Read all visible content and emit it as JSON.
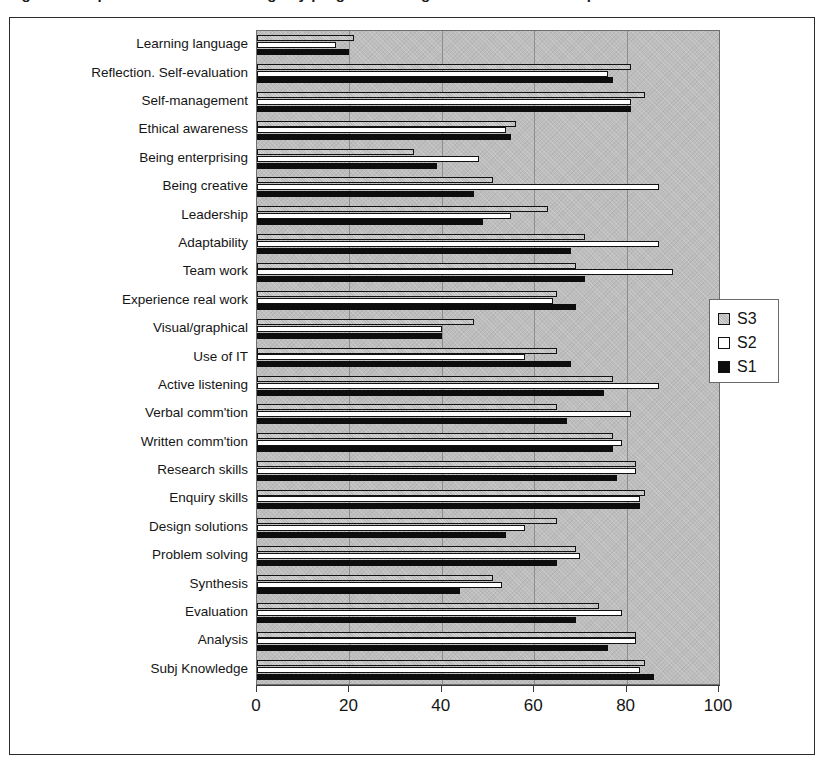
{
  "title": "Figure: Comparison of student ratings by programme stage across skills and capabilities",
  "chart_data": {
    "type": "bar",
    "orientation": "horizontal",
    "title": "",
    "xlabel": "",
    "ylabel": "",
    "xlim": [
      0,
      100
    ],
    "xticks": [
      0,
      20,
      40,
      60,
      80,
      100
    ],
    "xticklabels": [
      "0",
      "20",
      "40",
      "60",
      "80",
      "100"
    ],
    "grid": true,
    "grid_axis": "x",
    "legend_position": "right",
    "plot_background": "#bdbdbd",
    "series": [
      {
        "name": "S3",
        "color": "#b9b9b9",
        "values": [
          21,
          81,
          84,
          56,
          34,
          51,
          63,
          71,
          69,
          65,
          47,
          65,
          77,
          65,
          77,
          82,
          84,
          65,
          69,
          51,
          74,
          82,
          84
        ]
      },
      {
        "name": "S2",
        "color": "#ffffff",
        "values": [
          17,
          76,
          81,
          54,
          48,
          87,
          55,
          87,
          90,
          64,
          40,
          58,
          87,
          81,
          79,
          82,
          83,
          58,
          70,
          53,
          79,
          82,
          83
        ]
      },
      {
        "name": "S1",
        "color": "#0d0d0d",
        "values": [
          20,
          77,
          81,
          55,
          39,
          47,
          49,
          68,
          71,
          69,
          40,
          68,
          75,
          67,
          77,
          78,
          83,
          54,
          65,
          44,
          69,
          76,
          86
        ]
      }
    ],
    "categories": [
      "Learning language",
      "Reflection. Self-evaluation",
      "Self-management",
      "Ethical awareness",
      "Being enterprising",
      "Being creative",
      "Leadership",
      "Adaptability",
      "Team work",
      "Experience real work",
      "Visual/graphical",
      "Use of IT",
      "Active listening",
      "Verbal comm'tion",
      "Written comm'tion",
      "Research skills",
      "Enquiry skills",
      "Design solutions",
      "Problem solving",
      "Synthesis",
      "Evaluation",
      "Analysis",
      "Subj Knowledge"
    ]
  }
}
